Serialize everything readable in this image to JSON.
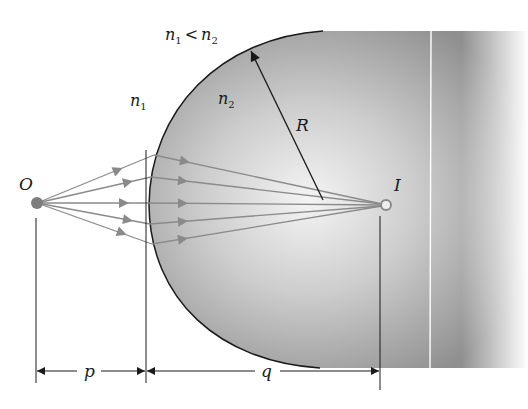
{
  "diagram": {
    "labels": {
      "condition": {
        "n1": "n",
        "n1_sub": "1",
        "lt": "<",
        "n2": "n",
        "n2_sub": "2"
      },
      "medium1": {
        "n": "n",
        "sub": "1"
      },
      "medium2": {
        "n": "n",
        "sub": "2"
      },
      "radius": "R",
      "object": "O",
      "image": "I",
      "object_distance": "p",
      "image_distance": "q"
    },
    "colors": {
      "rod_dark": "#8c8c8c",
      "rod_light": "#f2f2f2",
      "ray": "#8a8a8a",
      "outline": "#1a1a1a",
      "point": "#7d7d7d"
    },
    "rays": {
      "count": 5
    }
  }
}
